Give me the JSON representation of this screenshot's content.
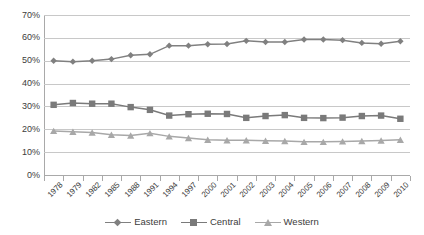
{
  "chart_data": {
    "type": "line",
    "title": "",
    "subtitle": "",
    "xlabel": "",
    "ylabel": "",
    "ylim": [
      0,
      70
    ],
    "ytick_values": [
      0,
      10,
      20,
      30,
      40,
      50,
      60,
      70
    ],
    "ytick_labels": [
      "0%",
      "10%",
      "20%",
      "30%",
      "40%",
      "50%",
      "60%",
      "70%"
    ],
    "grid": "horizontal",
    "legend_position": "bottom",
    "categories": [
      "1978",
      "1979",
      "1982",
      "1985",
      "1988",
      "1991",
      "1994",
      "1997",
      "2000",
      "2001",
      "2002",
      "2003",
      "2004",
      "2005",
      "2006",
      "2007",
      "2008",
      "2009",
      "2010"
    ],
    "series": [
      {
        "name": "Eastern",
        "marker": "diamond",
        "color": "#808080",
        "values": [
          50.0,
          49.6,
          50.0,
          50.7,
          52.4,
          52.8,
          56.6,
          56.6,
          57.2,
          57.3,
          58.7,
          58.2,
          58.2,
          59.3,
          59.3,
          59.0,
          57.8,
          57.4,
          58.5
        ]
      },
      {
        "name": "Central",
        "marker": "square",
        "color": "#7a7a7a",
        "values": [
          30.7,
          31.5,
          31.2,
          31.2,
          29.7,
          28.5,
          26.0,
          26.6,
          26.8,
          26.7,
          25.0,
          25.8,
          26.2,
          25.0,
          24.9,
          25.1,
          25.8,
          26.0,
          24.6
        ]
      },
      {
        "name": "Western",
        "marker": "triangle",
        "color": "#a8a8a8",
        "values": [
          19.3,
          18.9,
          18.6,
          17.6,
          17.3,
          18.3,
          16.9,
          16.2,
          15.4,
          15.2,
          15.2,
          15.0,
          14.9,
          14.5,
          14.5,
          14.7,
          14.9,
          15.1,
          15.4
        ]
      }
    ]
  },
  "colors": {
    "gridline": "#c8c8c8",
    "axis": "#a9a9a9",
    "text": "#3c3c3c",
    "background": "#ffffff"
  }
}
